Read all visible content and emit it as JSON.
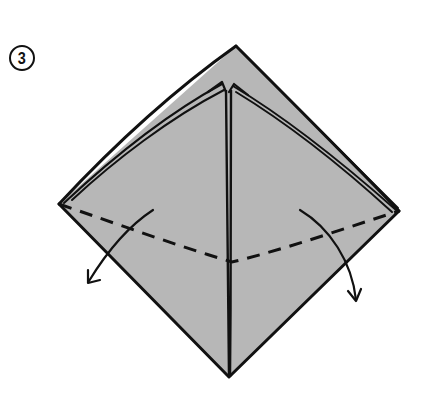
{
  "step": {
    "number": "3",
    "label": "Step 3"
  },
  "diagram": {
    "paper_color": "#b7b7b7",
    "line_color": "#111111",
    "background": "#ffffff",
    "shapes": {
      "outline": "diamond (square base, open edges up)",
      "fold_line": "valley fold dashed line across lower half",
      "arrows": [
        "left-flap-down-left",
        "right-flap-down-right"
      ]
    }
  }
}
